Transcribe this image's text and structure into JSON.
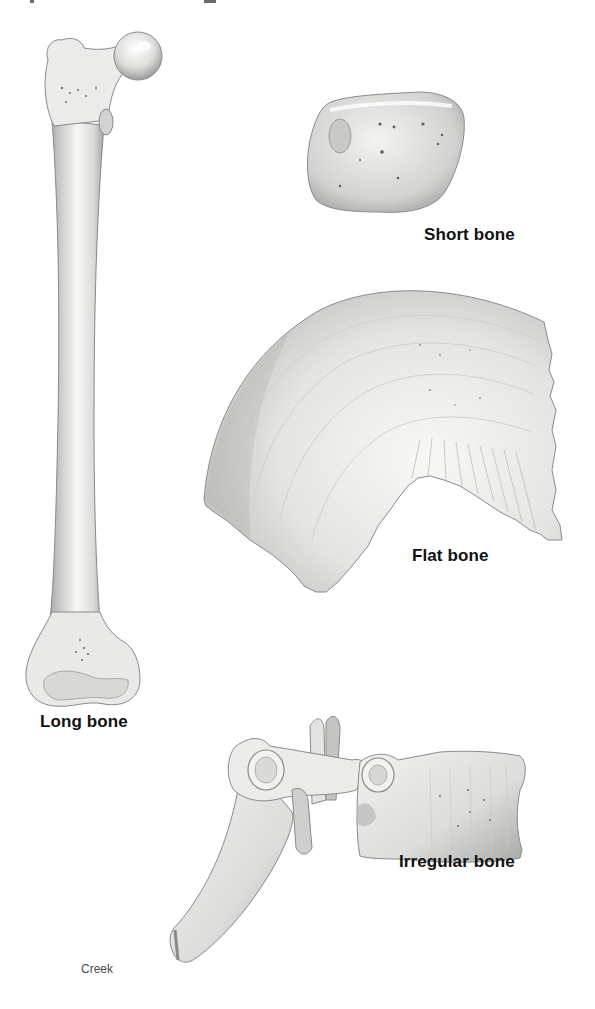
{
  "figure": {
    "bones": [
      {
        "id": "long",
        "label": "Long bone"
      },
      {
        "id": "short",
        "label": "Short bone"
      },
      {
        "id": "flat",
        "label": "Flat bone"
      },
      {
        "id": "irregular",
        "label": "Irregular bone"
      }
    ],
    "credit": "Creek",
    "colors": {
      "background": "#ffffff",
      "bone_light": "#f4f4f2",
      "bone_mid": "#d6d6d4",
      "bone_shadow": "#9a9a98",
      "outline": "#7a7a78",
      "label": "#111111",
      "credit": "#4a4a4a"
    }
  }
}
